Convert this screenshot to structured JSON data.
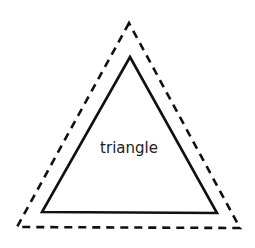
{
  "diagram": {
    "shape_label": "triangle",
    "outer_triangle": {
      "style": "dashed",
      "points": [
        [
          129,
          23
        ],
        [
          17,
          227
        ],
        [
          240,
          228
        ]
      ],
      "stroke": "#111111"
    },
    "inner_triangle": {
      "style": "solid",
      "points": [
        [
          130,
          57
        ],
        [
          42,
          212
        ],
        [
          217,
          213
        ]
      ],
      "stroke": "#111111"
    },
    "background": "#ffffff"
  }
}
